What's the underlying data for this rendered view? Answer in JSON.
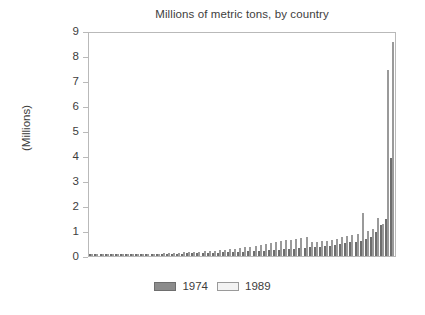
{
  "chart_data": {
    "type": "bar",
    "title": "Millions of metric tons, by country",
    "xlabel": "",
    "ylabel": "(Millions)",
    "ylim": [
      0,
      9
    ],
    "yticks": [
      "0",
      "1",
      "2",
      "3",
      "4",
      "5",
      "6",
      "7",
      "8",
      "9"
    ],
    "grid": false,
    "legend_position": "bottom-center",
    "xtick_labels": [],
    "categories": [
      "C1",
      "C2",
      "C3",
      "C4",
      "C5",
      "C6",
      "C7",
      "C8",
      "C9",
      "C10",
      "C11",
      "C12",
      "C13",
      "C14",
      "C15",
      "C16",
      "C17",
      "C18",
      "C19",
      "C20",
      "C21",
      "C22",
      "C23",
      "C24",
      "C25",
      "C26",
      "C27",
      "C28",
      "C29",
      "C30",
      "C31",
      "C32",
      "C33",
      "C34",
      "C35",
      "C36",
      "C37",
      "C38",
      "C39",
      "C40",
      "C41",
      "C42",
      "C43",
      "C44",
      "C45",
      "C46",
      "C47",
      "C48",
      "C49",
      "C50",
      "C51",
      "C52",
      "C53",
      "C54",
      "C55",
      "C56",
      "C57",
      "C58",
      "C59",
      "C60"
    ],
    "series": [
      {
        "name": "1974",
        "color": "#8c8c8c",
        "values": [
          0.01,
          0.01,
          0.02,
          0.02,
          0.03,
          0.03,
          0.04,
          0.04,
          0.05,
          0.05,
          0.06,
          0.06,
          0.07,
          0.07,
          0.08,
          0.08,
          0.09,
          0.1,
          0.1,
          0.11,
          0.11,
          0.12,
          0.12,
          0.13,
          0.14,
          0.14,
          0.15,
          0.16,
          0.16,
          0.17,
          0.18,
          0.19,
          0.2,
          0.21,
          0.22,
          0.23,
          0.25,
          0.26,
          0.27,
          0.29,
          0.3,
          0.32,
          0.33,
          0.35,
          0.37,
          0.38,
          0.4,
          0.42,
          0.45,
          0.48,
          0.52,
          0.55,
          0.58,
          0.62,
          0.68,
          0.75,
          0.95,
          1.25,
          1.5,
          3.95
        ]
      },
      {
        "name": "1989",
        "color": "#f1f1f1",
        "values": [
          0.02,
          0.02,
          0.03,
          0.03,
          0.04,
          0.05,
          0.05,
          0.06,
          0.06,
          0.07,
          0.08,
          0.08,
          0.09,
          0.1,
          0.11,
          0.12,
          0.13,
          0.14,
          0.15,
          0.16,
          0.17,
          0.18,
          0.19,
          0.2,
          0.22,
          0.24,
          0.26,
          0.28,
          0.3,
          0.33,
          0.36,
          0.38,
          0.41,
          0.44,
          0.48,
          0.52,
          0.56,
          0.6,
          0.63,
          0.66,
          0.7,
          0.74,
          0.78,
          0.55,
          0.58,
          0.6,
          0.62,
          0.65,
          0.7,
          0.75,
          0.8,
          0.85,
          0.9,
          1.72,
          1.0,
          1.1,
          1.55,
          1.3,
          7.5,
          8.62
        ]
      }
    ]
  },
  "legend": {
    "entries": [
      {
        "label": "1974",
        "color": "#8c8c8c"
      },
      {
        "label": "1989",
        "color": "#f1f1f1"
      }
    ]
  }
}
